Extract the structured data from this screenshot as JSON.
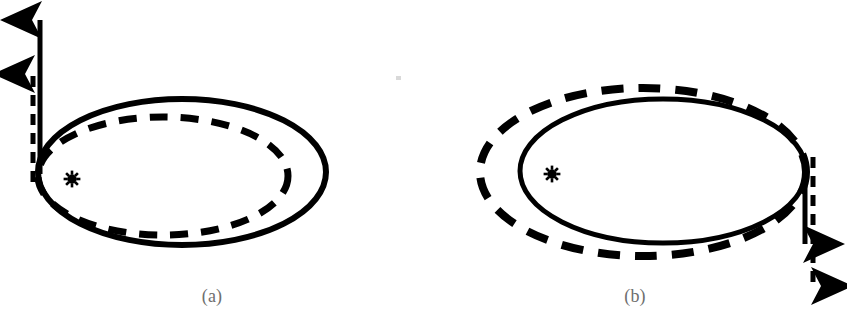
{
  "figure": {
    "type": "scientific-diagram",
    "background_color": "#ffffff",
    "stroke_color": "#000000",
    "caption_color": "#6e6e6e",
    "width": 847,
    "height": 326
  },
  "panels": [
    {
      "id": "a",
      "caption": "(a)",
      "star_symbol": "✻",
      "star_label": "sun",
      "star_center": {
        "x": 72,
        "y": 179
      },
      "solid_orbit": {
        "name": "original-orbit",
        "style": "solid",
        "center": {
          "x": 182,
          "y": 172
        },
        "rx": 144,
        "ry": 73,
        "stroke_width": 6
      },
      "dashed_orbit": {
        "name": "modified-orbit",
        "style": "dashed",
        "center": {
          "x": 163,
          "y": 176
        },
        "rx": 125,
        "ry": 59,
        "stroke_width": 7,
        "dash": "18 13",
        "relation": "smaller, inscribed, tangent at left apse"
      },
      "arrows": [
        {
          "name": "velocity-arrow-solid",
          "style": "solid",
          "direction": "up",
          "from": {
            "x": 40,
            "y": 174
          },
          "to": {
            "x": 40,
            "y": 16
          },
          "length": 158,
          "stroke_width": 5
        },
        {
          "name": "velocity-arrow-dashed",
          "style": "dashed",
          "direction": "up",
          "from": {
            "x": 33,
            "y": 182
          },
          "to": {
            "x": 33,
            "y": 70
          },
          "length": 112,
          "stroke_width": 5,
          "dash": "11 8"
        }
      ]
    },
    {
      "id": "b",
      "caption": "(b)",
      "star_symbol": "✻",
      "star_label": "sun",
      "star_center": {
        "x": 129,
        "y": 174
      },
      "solid_orbit": {
        "name": "original-orbit",
        "style": "solid",
        "center": {
          "x": 240,
          "y": 171
        },
        "rx": 143,
        "ry": 72,
        "stroke_width": 5
      },
      "dashed_orbit": {
        "name": "modified-orbit",
        "style": "dashed",
        "center": {
          "x": 220,
          "y": 172
        },
        "rx": 163,
        "ry": 84,
        "stroke_width": 8,
        "dash": "22 15",
        "relation": "larger, circumscribed, tangent at right apse"
      },
      "arrows": [
        {
          "name": "velocity-arrow-solid",
          "style": "solid",
          "direction": "down",
          "from": {
            "x": 382,
            "y": 160
          },
          "to": {
            "x": 382,
            "y": 248
          },
          "length": 88,
          "stroke_width": 5
        },
        {
          "name": "velocity-arrow-dashed",
          "style": "dashed",
          "direction": "down",
          "from": {
            "x": 390,
            "y": 157
          },
          "to": {
            "x": 390,
            "y": 290
          },
          "length": 133,
          "stroke_width": 5,
          "dash": "11 8"
        }
      ]
    }
  ]
}
